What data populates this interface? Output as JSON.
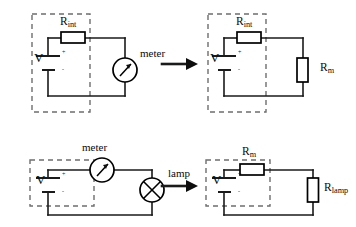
{
  "figure": {
    "title": "",
    "type": "circuit-diagram",
    "panel_count": 4,
    "colors": {
      "wire": "#1a1a1a",
      "dashed_box": "#6e6e6e",
      "component": "#000000",
      "background": "#ffffff",
      "arrow": "#0d0d0d"
    }
  },
  "panels": {
    "top_left": {
      "name": "real-source-with-meter",
      "source_label": "V",
      "internal_resistor_label": "R",
      "internal_resistor_sub": "int",
      "meter_label": "meter",
      "battery_plus": "+",
      "battery_minus": "-",
      "dashed_box_meaning": "real voltage source"
    },
    "top_right": {
      "name": "real-source-with-meter-resistance",
      "source_label": "V",
      "internal_resistor_label": "R",
      "internal_resistor_sub": "int",
      "meter_resistor_label": "R",
      "meter_resistor_sub": "m",
      "battery_plus": "+",
      "battery_minus": "-"
    },
    "bottom_left": {
      "name": "ideal-source-meter-lamp",
      "source_label": "V",
      "meter_label": "meter",
      "lamp_label": "lamp",
      "battery_plus": "+",
      "battery_minus": "-"
    },
    "bottom_right": {
      "name": "ideal-source-meter-lamp-resistances",
      "source_label": "V",
      "meter_resistor_label": "R",
      "meter_resistor_sub": "m",
      "lamp_resistor_label": "R",
      "lamp_resistor_sub": "lamp",
      "battery_plus": "+",
      "battery_minus": "-"
    }
  },
  "arrows": {
    "top": {
      "name": "transform-arrow-top",
      "glyph": "→"
    },
    "bottom": {
      "name": "transform-arrow-bottom",
      "glyph": "→"
    }
  }
}
